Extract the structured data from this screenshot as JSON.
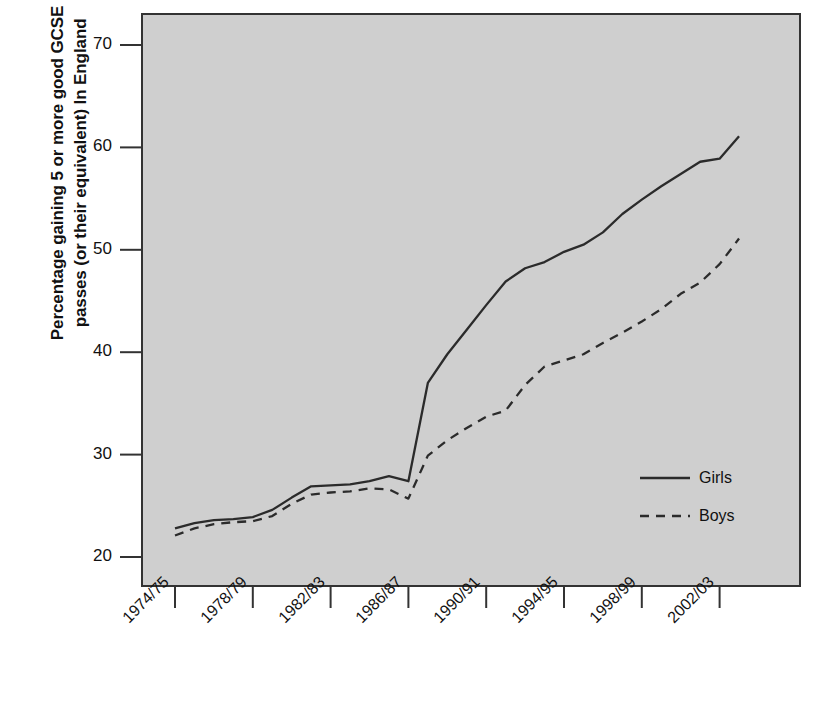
{
  "chart_data": {
    "type": "line",
    "title": "",
    "subtitle": "",
    "xlabel": "",
    "ylabel": "Percentage gaining 5 or more good GCSE passes (or their equivalent) In England",
    "ylabel_line1": "Percentage gaining 5 or more good GCSE",
    "ylabel_line2": "passes (or their equivalent) In England",
    "grid": false,
    "legend_position": "inside-right-lower",
    "xlim": [
      "1974/75",
      "2003/04"
    ],
    "ylim": [
      17.5,
      73
    ],
    "y_ticks": [
      20,
      30,
      40,
      50,
      60,
      70
    ],
    "x_ticks": [
      "1974/75",
      "1978/79",
      "1982/83",
      "1986/87",
      "1990/91",
      "1994/95",
      "1998/99",
      "2002/03"
    ],
    "x": [
      "1974/75",
      "1975/76",
      "1976/77",
      "1977/78",
      "1978/79",
      "1979/80",
      "1980/81",
      "1981/82",
      "1982/83",
      "1983/84",
      "1984/85",
      "1985/86",
      "1986/87",
      "1987/88",
      "1988/89",
      "1989/90",
      "1990/91",
      "1991/92",
      "1992/93",
      "1993/94",
      "1994/95",
      "1995/96",
      "1996/97",
      "1997/98",
      "1998/99",
      "1999/00",
      "2000/01",
      "2001/02",
      "2002/03",
      "2003/04"
    ],
    "series": [
      {
        "name": "Girls",
        "style": "solid",
        "color": "#2b2b2b",
        "values": [
          22.8,
          23.3,
          23.6,
          23.7,
          23.9,
          24.6,
          25.8,
          26.9,
          27.0,
          27.1,
          27.4,
          27.9,
          27.4,
          37.0,
          39.8,
          42.2,
          44.6,
          46.9,
          48.2,
          48.8,
          49.8,
          50.5,
          51.7,
          53.5,
          54.9,
          56.2,
          57.4,
          58.6,
          58.9,
          61.1
        ]
      },
      {
        "name": "Boys",
        "style": "dashed",
        "color": "#2b2b2b",
        "values": [
          22.1,
          22.8,
          23.2,
          23.4,
          23.5,
          24.0,
          25.2,
          26.1,
          26.3,
          26.4,
          26.7,
          26.6,
          25.7,
          29.9,
          31.4,
          32.6,
          33.7,
          34.3,
          36.8,
          38.6,
          39.2,
          39.8,
          40.9,
          41.9,
          43.0,
          44.2,
          45.7,
          46.8,
          48.6,
          51.1
        ]
      }
    ],
    "legend": [
      {
        "label": "Girls",
        "style": "solid"
      },
      {
        "label": "Boys",
        "style": "dashed"
      }
    ],
    "colors": {
      "plot_background": "#cfcfcf",
      "page_background": "#ffffff",
      "axis": "#333333",
      "line": "#2b2b2b",
      "text": "#111111"
    },
    "geometry": {
      "plot_left": 142,
      "plot_right": 800,
      "plot_top": 14,
      "plot_bottom": 586,
      "y_at_20": 557,
      "y_at_70": 45,
      "x_first": 175,
      "x_step": 19.45
    }
  }
}
